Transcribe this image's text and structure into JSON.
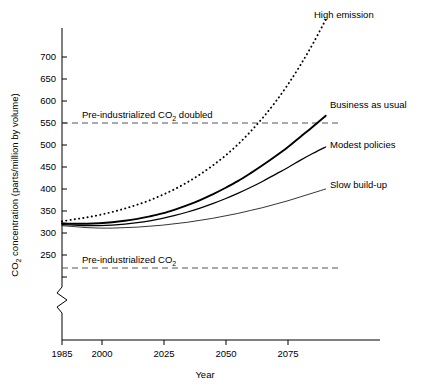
{
  "chart_data": {
    "type": "line",
    "title": "",
    "xlabel": "Year",
    "ylabel": "CO2 concentration (parts/million by volume)",
    "ylabel_parts": {
      "pre": "CO",
      "sub": "2",
      "post": " concentration (parts/million by volume)"
    },
    "xlim": [
      1985,
      2095
    ],
    "ylim": [
      240,
      735
    ],
    "grid": false,
    "legend_position": "right-inline",
    "axis_break": {
      "present": true,
      "below_value": 250,
      "axis": "y"
    },
    "xticks": [
      1985,
      2000,
      2025,
      2050,
      2075
    ],
    "xtick_labels": [
      "1985",
      "2000",
      "2025",
      "2050",
      "2075"
    ],
    "yticks": [
      250,
      300,
      350,
      400,
      450,
      500,
      550,
      600,
      650,
      700
    ],
    "ytick_labels": [
      "250",
      "300",
      "350",
      "400",
      "450",
      "500",
      "550",
      "600",
      "650",
      "700"
    ],
    "x": [
      1985,
      1990,
      1995,
      2000,
      2005,
      2010,
      2015,
      2020,
      2025,
      2030,
      2035,
      2040,
      2045,
      2050,
      2055,
      2060,
      2065,
      2070,
      2075,
      2080,
      2085,
      2090
    ],
    "series": [
      {
        "name": "High emission",
        "style": "dotted",
        "label_x": 2095,
        "label_y": 735,
        "values": [
          364,
          368,
          372,
          377,
          383,
          390,
          398,
          407,
          418,
          430,
          444,
          460,
          478,
          498,
          521,
          547,
          576,
          608,
          644,
          684,
          728,
          776
        ]
      },
      {
        "name": "Business as usual",
        "style": "thick-solid",
        "label_x": 2095,
        "label_y": 600,
        "values": [
          360,
          359,
          359,
          360,
          362,
          365,
          369,
          374,
          380,
          388,
          397,
          407,
          419,
          432,
          446,
          462,
          479,
          497,
          516,
          537,
          558,
          580
        ]
      },
      {
        "name": "Modest policies",
        "style": "medium-solid",
        "label_x": 2095,
        "label_y": 545,
        "values": [
          357,
          356,
          355,
          355,
          356,
          358,
          361,
          365,
          370,
          376,
          383,
          391,
          400,
          410,
          421,
          433,
          446,
          460,
          474,
          489,
          503,
          516
        ]
      },
      {
        "name": "Slow build-up",
        "style": "thin-solid",
        "label_x": 2095,
        "label_y": 455,
        "values": [
          355,
          353,
          351,
          350,
          350,
          351,
          352,
          354,
          356,
          359,
          362,
          366,
          370,
          375,
          380,
          386,
          392,
          399,
          406,
          414,
          422,
          430
        ]
      }
    ],
    "reference_lines": [
      {
        "name": "Pre-industrialized CO2 doubled",
        "label": "Pre-industrialized CO",
        "label_sub": "2",
        "label_post": " doubled",
        "value": 550,
        "style": "dashed"
      },
      {
        "name": "Pre-industrialized CO2",
        "label": "Pre-industrialized CO",
        "label_sub": "2",
        "label_post": "",
        "value": 270,
        "style": "dashed"
      }
    ]
  },
  "labels": {
    "xaxis_title": "Year",
    "yaxis_title_pre": "CO",
    "yaxis_title_sub": "2",
    "yaxis_title_post": " concentration (parts/million by volume)",
    "series": {
      "high_emission": "High emission",
      "business_as_usual": "Business as usual",
      "modest_policies": "Modest policies",
      "slow_build_up": "Slow build-up"
    },
    "refs": {
      "doubled_pre": "Pre-industrialized CO",
      "doubled_sub": "2",
      "doubled_post": " doubled",
      "base_pre": "Pre-industrialized CO",
      "base_sub": "2"
    },
    "yticks": [
      "250",
      "300",
      "350",
      "400",
      "450",
      "500",
      "550",
      "600",
      "650",
      "700"
    ],
    "xticks": [
      "1985",
      "2000",
      "2025",
      "2050",
      "2075"
    ]
  },
  "colors": {
    "axis": "#000000",
    "curve": "#000000",
    "reference": "#555555",
    "background": "#ffffff"
  }
}
